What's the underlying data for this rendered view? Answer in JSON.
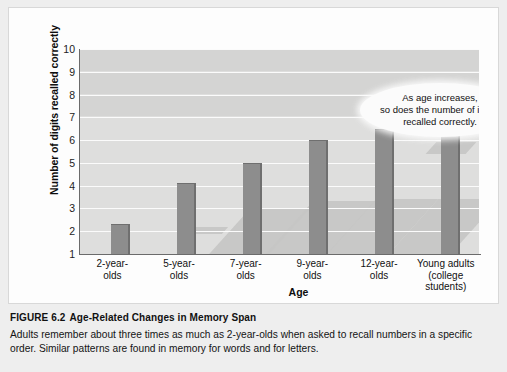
{
  "chart_data": {
    "type": "bar",
    "title": "Age-Related Changes in Memory Span",
    "xlabel": "Age",
    "ylabel": "Number of digits recalled correctly",
    "ylim": [
      1,
      10
    ],
    "yticks": [
      10,
      9,
      8,
      7,
      6,
      5,
      4,
      3,
      2,
      1
    ],
    "grid": true,
    "legend": "none",
    "categories": [
      "2-year-\nolds",
      "5-year-\nolds",
      "7-year-\nolds",
      "9-year-\nolds",
      "12-year-\nolds",
      "Young adults\n(college\nstudents)"
    ],
    "values": [
      2.3,
      4.1,
      5.0,
      6.0,
      6.5,
      7.1
    ],
    "annotations": [
      "As age increases,\nso does  the number of items\nrecalled correctly."
    ]
  },
  "figure": {
    "label": "FIGURE 6.2",
    "title": "Age-Related Changes in Memory Span",
    "caption": "Adults remember about three times as much as 2-year-olds when asked to recall numbers in a specific order. Similar patterns are found in memory for words and for letters."
  },
  "colors": {
    "bar_fill": "#8d8d8d",
    "bar_edge": "#6f6f6f",
    "plot_background": "#dededd",
    "gridline": "#fbfbfb",
    "panel_background": "#fdfdfd",
    "page_background": "#eeeeee",
    "text": "#111111"
  }
}
